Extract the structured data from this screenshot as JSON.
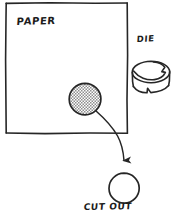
{
  "diagram": {
    "style": "hand-drawn pen sketch",
    "background_color": "#ffffff",
    "ink_color": "#262626"
  },
  "labels": {
    "paper": "PAPER",
    "die": "DIE",
    "cut_out": "CUT OUT"
  },
  "shapes": {
    "paper_sheet": {
      "name": "paper-sheet-rectangle",
      "x": 6,
      "y": 3,
      "width": 121,
      "height": 130
    },
    "shaded_circle": {
      "name": "shaded-circle-on-paper",
      "cx": 85,
      "cy": 99,
      "r": 16,
      "fill": "#b3b3b3",
      "fill_pattern": "stipple"
    },
    "die_cylinder": {
      "name": "die-cylinder",
      "cx": 151,
      "cy": 72,
      "rx": 19,
      "ry": 11,
      "height": 18,
      "edge": "serrated"
    },
    "cut_out_circle": {
      "name": "cut-out-circle",
      "cx": 124,
      "cy": 188,
      "r": 15,
      "fill": "#ffffff"
    },
    "arrow": {
      "name": "process-arrow",
      "from_x": 95,
      "from_y": 110,
      "to_x": 124,
      "to_y": 165,
      "style": "curved with filled arrowhead"
    }
  }
}
